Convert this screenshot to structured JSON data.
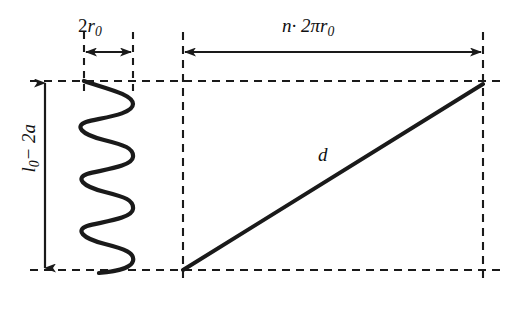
{
  "diagram": {
    "background_color": "#ffffff",
    "stroke_color": "#1a1a1a",
    "labels": {
      "coil_diameter": "2r0",
      "coil_diameter_base": "2",
      "coil_diameter_var": "r",
      "coil_diameter_sub": "0",
      "spring_height": "l0 - 2a",
      "spring_height_var": "l",
      "spring_height_sub": "0",
      "spring_height_rest": "− 2a",
      "unwound_length": "n · 2πr0",
      "unwound_length_n": "n",
      "unwound_length_mid": "· 2πr",
      "unwound_length_sub": "0",
      "diagonal": "d"
    },
    "geometry": {
      "top_line_y": 81,
      "bottom_line_y": 270,
      "spring_left_x": 84,
      "spring_right_x": 133,
      "right_block_left_x": 183,
      "right_block_right_x": 483,
      "vertical_arrow_x": 45,
      "horizontal_arrow_y": 52,
      "spring_cycles": 5.5,
      "diagonal_from": [
        183,
        270
      ],
      "diagonal_to": [
        483,
        84
      ]
    },
    "elements": {
      "coil_diameter_arrow": "double-headed horizontal arrow spanning coil width",
      "unwound_length_arrow": "double-headed horizontal arrow spanning unwound length",
      "spring_height_arrow": "double-headed vertical arrow spanning spring height",
      "helix": "sinusoidal spring coil profile",
      "diagonal_line": "hypotenuse representing wire length d"
    }
  }
}
